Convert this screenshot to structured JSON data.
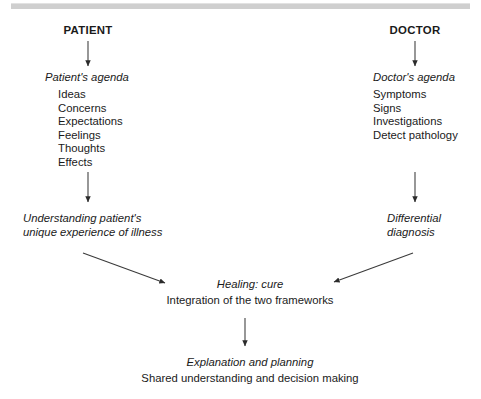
{
  "figure": {
    "type": "flow-diagram",
    "title_bar_color": "#cfcfcf",
    "line_color": "#3a3a3a",
    "background": "#ffffff"
  },
  "columns": {
    "patient": {
      "heading": "PATIENT",
      "agenda_label": "Patient's agenda",
      "agenda_items": [
        "Ideas",
        "Concerns",
        "Expectations",
        "Feelings",
        "Thoughts",
        "Effects"
      ],
      "outcome_line1": "Understanding patient's",
      "outcome_line2": "unique experience of illness"
    },
    "doctor": {
      "heading": "DOCTOR",
      "agenda_label": "Doctor's agenda",
      "agenda_items": [
        "Symptoms",
        "Signs",
        "Investigations",
        "Detect pathology"
      ],
      "outcome_line1": "Differential",
      "outcome_line2": "diagnosis"
    }
  },
  "convergence": {
    "title": "Healing: cure",
    "subtitle": "Integration of the two frameworks"
  },
  "conclusion": {
    "title": "Explanation and planning",
    "subtitle": "Shared understanding and decision making"
  },
  "arrows": [
    {
      "name": "patient-to-agenda",
      "direction": "down"
    },
    {
      "name": "doctor-to-agenda",
      "direction": "down"
    },
    {
      "name": "patient-agenda-to-understanding",
      "direction": "down"
    },
    {
      "name": "doctor-agenda-to-diagnosis",
      "direction": "down"
    },
    {
      "name": "understanding-to-healing",
      "direction": "down-right"
    },
    {
      "name": "diagnosis-to-healing",
      "direction": "down-left"
    },
    {
      "name": "healing-to-explanation",
      "direction": "down"
    }
  ]
}
